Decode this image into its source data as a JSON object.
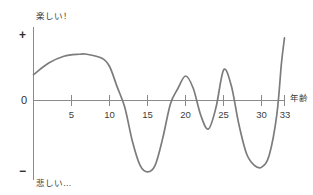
{
  "chart_data": {
    "type": "line",
    "title": "",
    "subtitle": "",
    "xlabel": "年齢",
    "ylabel": "",
    "y_top_label": "楽しい！",
    "y_bottom_label": "悲しい…",
    "y_axis_symbols": {
      "positive": "+",
      "zero": "0",
      "negative": "−"
    },
    "x_ticks": [
      {
        "value": 5,
        "label": "5"
      },
      {
        "value": 10,
        "label": "10"
      },
      {
        "value": 15,
        "label": "15"
      },
      {
        "value": 20,
        "label": "20"
      },
      {
        "value": 25,
        "label": "25"
      },
      {
        "value": 30,
        "label": "30"
      },
      {
        "value": 33,
        "label": "33"
      }
    ],
    "xlim": [
      0,
      33
    ],
    "ylim": [
      -1,
      1
    ],
    "grid": false,
    "legend": false,
    "legend_position": "none",
    "series": [
      {
        "name": "happiness",
        "x": [
          0,
          2,
          4,
          6,
          7,
          9,
          10,
          11,
          12,
          13,
          14,
          15,
          16,
          17,
          18,
          19,
          20,
          21,
          22,
          23,
          24,
          25,
          26,
          27,
          28,
          29,
          30,
          31,
          32,
          32.6,
          33
        ],
        "values": [
          0.38,
          0.55,
          0.65,
          0.68,
          0.68,
          0.62,
          0.5,
          0.2,
          -0.1,
          -0.6,
          -0.95,
          -1.05,
          -0.95,
          -0.55,
          -0.05,
          0.18,
          0.36,
          0.18,
          -0.22,
          -0.42,
          -0.1,
          0.45,
          0.22,
          -0.35,
          -0.78,
          -0.95,
          -0.98,
          -0.8,
          -0.2,
          0.55,
          0.92
        ]
      }
    ],
    "colors": {
      "curve": "#7c7c7c",
      "axis": "#8a8a8a",
      "text": "#3a3a3a",
      "background": "#ffffff"
    }
  }
}
